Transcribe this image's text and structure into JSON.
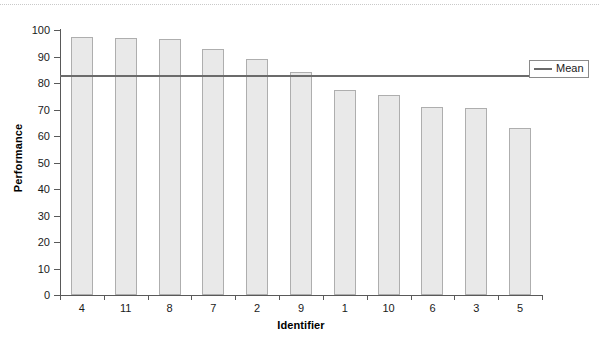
{
  "chart_data": {
    "type": "bar",
    "title": "",
    "subtitle": "",
    "xlabel": "Identifier",
    "ylabel": "Performance",
    "categories": [
      "4",
      "11",
      "8",
      "7",
      "2",
      "9",
      "1",
      "10",
      "6",
      "3",
      "5"
    ],
    "values": [
      97.5,
      97.0,
      96.5,
      93.0,
      89.0,
      84.0,
      77.5,
      75.5,
      71.0,
      70.5,
      63.0
    ],
    "series": [
      {
        "name": "Performance",
        "values": [
          97.5,
          97.0,
          96.5,
          93.0,
          89.0,
          84.0,
          77.5,
          75.5,
          71.0,
          70.5,
          63.0
        ]
      }
    ],
    "reference_lines": [
      {
        "name": "Mean",
        "value": 82.5,
        "color": "#6b6b6b"
      }
    ],
    "ylim": [
      0,
      100
    ],
    "ytick_labels": [
      "0",
      "10",
      "20",
      "30",
      "40",
      "50",
      "60",
      "70",
      "80",
      "90",
      "100"
    ],
    "ytick_values": [
      0,
      10,
      20,
      30,
      40,
      50,
      60,
      70,
      80,
      90,
      100
    ],
    "grid": false,
    "legend_position": "top-right",
    "legend_entries": [
      "Mean"
    ],
    "bar_fill_color": "#e9e9e9",
    "bar_border_color": "#aeaeae",
    "axis_color": "#595959",
    "background_color": "#ffffff"
  },
  "legend": {
    "mean_label": "Mean"
  }
}
